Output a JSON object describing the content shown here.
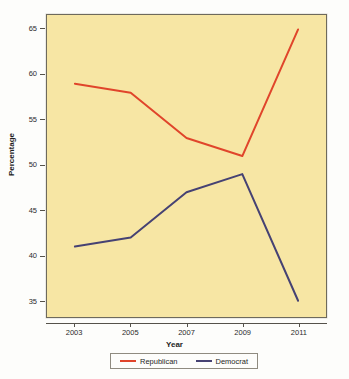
{
  "chart_data": {
    "type": "line",
    "title": "",
    "xlabel": "Year",
    "ylabel": "Percentage",
    "x": [
      2003,
      2005,
      2007,
      2009,
      2011
    ],
    "categories": [
      "2003",
      "2005",
      "2007",
      "2009",
      "2011"
    ],
    "xlim": [
      2002,
      2012
    ],
    "ylim": [
      33.2,
      66.6
    ],
    "yticks": [
      35,
      40,
      45,
      50,
      55,
      60,
      65
    ],
    "ytick_labels": [
      "35",
      "40",
      "45",
      "50",
      "55",
      "60",
      "65"
    ],
    "xticks": [
      2003,
      2005,
      2007,
      2009,
      2011
    ],
    "xtick_labels": [
      "2003",
      "2005",
      "2007",
      "2009",
      "2011"
    ],
    "grid": false,
    "legend_position": "bottom",
    "plot_background": "#f7e6a4",
    "figure_background": "#fdfdfb",
    "axis_color": "#55524a",
    "series": [
      {
        "name": "Republican",
        "color": "#e0452b",
        "values": [
          59,
          58,
          53,
          51,
          65
        ]
      },
      {
        "name": "Democrat",
        "color": "#464273",
        "values": [
          41,
          42,
          47,
          49,
          35
        ]
      }
    ]
  },
  "legend": {
    "entries": [
      {
        "label": "Republican",
        "color": "#e0452b"
      },
      {
        "label": "Democrat",
        "color": "#464273"
      }
    ]
  }
}
